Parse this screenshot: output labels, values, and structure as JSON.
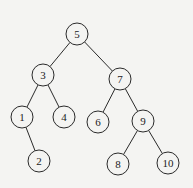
{
  "diagram": {
    "type": "binary-tree",
    "colors": {
      "background": "#f4f4f2",
      "stroke": "#2a2a2a",
      "node_fill": "#f4f4f2",
      "text": "#222222"
    },
    "node_radius": 11,
    "nodes": [
      {
        "id": "5",
        "label": "5",
        "x": 77,
        "y": 34
      },
      {
        "id": "3",
        "label": "3",
        "x": 43,
        "y": 75
      },
      {
        "id": "7",
        "label": "7",
        "x": 120,
        "y": 79
      },
      {
        "id": "1",
        "label": "1",
        "x": 22,
        "y": 117
      },
      {
        "id": "4",
        "label": "4",
        "x": 64,
        "y": 117
      },
      {
        "id": "6",
        "label": "6",
        "x": 98,
        "y": 122
      },
      {
        "id": "9",
        "label": "9",
        "x": 143,
        "y": 121
      },
      {
        "id": "2",
        "label": "2",
        "x": 39,
        "y": 161
      },
      {
        "id": "8",
        "label": "8",
        "x": 118,
        "y": 164
      },
      {
        "id": "10",
        "label": "10",
        "x": 168,
        "y": 163
      }
    ],
    "edges": [
      {
        "from": "5",
        "to": "3"
      },
      {
        "from": "5",
        "to": "7"
      },
      {
        "from": "3",
        "to": "1"
      },
      {
        "from": "3",
        "to": "4"
      },
      {
        "from": "1",
        "to": "2"
      },
      {
        "from": "7",
        "to": "6"
      },
      {
        "from": "7",
        "to": "9"
      },
      {
        "from": "9",
        "to": "8"
      },
      {
        "from": "9",
        "to": "10"
      }
    ]
  }
}
